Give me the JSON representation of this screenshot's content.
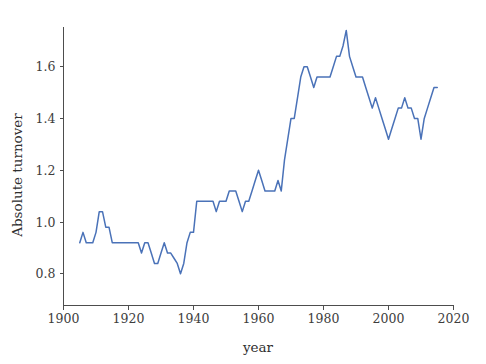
{
  "chart_data": {
    "type": "line",
    "title": "",
    "xlabel": "year",
    "ylabel": "Absolute turnover",
    "xlim": [
      1900,
      2020
    ],
    "ylim": [
      0.78,
      1.76
    ],
    "grid": false,
    "legend": null,
    "line_color": "#4a72b8",
    "axis_color": "#4d4d4d",
    "background_color": "#ffffff",
    "xticks": [
      1900,
      1920,
      1940,
      1960,
      1980,
      2000,
      2020
    ],
    "xtick_labels": [
      "1900",
      "1920",
      "1940",
      "1960",
      "1980",
      "2000",
      "2020"
    ],
    "yticks": [
      0.8,
      1.0,
      1.2,
      1.4,
      1.6
    ],
    "ytick_labels": [
      "0.8",
      "1.0",
      "1.2",
      "1.4",
      "1.6"
    ],
    "series": [
      {
        "name": "Absolute turnover",
        "x": [
          1905,
          1906,
          1907,
          1908,
          1909,
          1910,
          1911,
          1912,
          1913,
          1914,
          1915,
          1916,
          1917,
          1918,
          1919,
          1920,
          1921,
          1922,
          1923,
          1924,
          1925,
          1926,
          1927,
          1928,
          1929,
          1930,
          1931,
          1932,
          1933,
          1934,
          1935,
          1936,
          1937,
          1938,
          1939,
          1940,
          1941,
          1942,
          1943,
          1944,
          1945,
          1946,
          1947,
          1948,
          1949,
          1950,
          1951,
          1952,
          1953,
          1954,
          1955,
          1956,
          1957,
          1958,
          1959,
          1960,
          1961,
          1962,
          1963,
          1964,
          1965,
          1966,
          1967,
          1968,
          1969,
          1970,
          1971,
          1972,
          1973,
          1974,
          1975,
          1976,
          1977,
          1978,
          1979,
          1980,
          1981,
          1982,
          1983,
          1984,
          1985,
          1986,
          1987,
          1988,
          1989,
          1990,
          1991,
          1992,
          1993,
          1994,
          1995,
          1996,
          1997,
          1998,
          1999,
          2000,
          2001,
          2002,
          2003,
          2004,
          2005,
          2006,
          2007,
          2008,
          2009,
          2010,
          2011,
          2012,
          2013,
          2014,
          2015
        ],
        "y": [
          0.92,
          0.96,
          0.92,
          0.92,
          0.92,
          0.96,
          1.04,
          1.04,
          0.98,
          0.98,
          0.92,
          0.92,
          0.92,
          0.92,
          0.92,
          0.92,
          0.92,
          0.92,
          0.92,
          0.88,
          0.92,
          0.92,
          0.88,
          0.84,
          0.84,
          0.88,
          0.92,
          0.88,
          0.88,
          0.86,
          0.84,
          0.8,
          0.84,
          0.92,
          0.96,
          0.96,
          1.08,
          1.08,
          1.08,
          1.08,
          1.08,
          1.08,
          1.04,
          1.08,
          1.08,
          1.08,
          1.12,
          1.12,
          1.12,
          1.08,
          1.04,
          1.08,
          1.08,
          1.12,
          1.16,
          1.2,
          1.16,
          1.12,
          1.12,
          1.12,
          1.12,
          1.16,
          1.12,
          1.24,
          1.32,
          1.4,
          1.4,
          1.48,
          1.56,
          1.6,
          1.6,
          1.56,
          1.52,
          1.56,
          1.56,
          1.56,
          1.56,
          1.56,
          1.6,
          1.64,
          1.64,
          1.68,
          1.74,
          1.64,
          1.6,
          1.56,
          1.56,
          1.56,
          1.52,
          1.48,
          1.44,
          1.48,
          1.44,
          1.4,
          1.36,
          1.32,
          1.36,
          1.4,
          1.44,
          1.44,
          1.48,
          1.44,
          1.44,
          1.4,
          1.4,
          1.32,
          1.4,
          1.44,
          1.48,
          1.52,
          1.52
        ]
      }
    ]
  },
  "axes": {
    "x_title": "year",
    "y_title": "Absolute turnover"
  }
}
